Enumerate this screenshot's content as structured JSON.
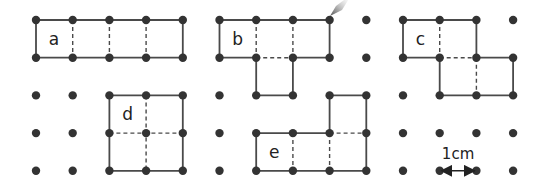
{
  "grid": {
    "cols": 14,
    "rows": 5,
    "origin_x": 36,
    "origin_y": 20,
    "step_x": 36.7,
    "step_y": 37.7,
    "dot_radius": 4.2,
    "dot_color": "#333333",
    "line_color": "#4a4a4a"
  },
  "shapes": [
    {
      "label": "a",
      "label_pos": [
        0.35,
        0.5
      ],
      "outline": [
        [
          0,
          0
        ],
        [
          4,
          0
        ],
        [
          4,
          1
        ],
        [
          0,
          1
        ]
      ],
      "dashed": [
        [
          [
            1,
            0
          ],
          [
            1,
            1
          ]
        ],
        [
          [
            2,
            0
          ],
          [
            2,
            1
          ]
        ],
        [
          [
            3,
            0
          ],
          [
            3,
            1
          ]
        ]
      ]
    },
    {
      "label": "b",
      "label_pos": [
        5.35,
        0.5
      ],
      "outline": [
        [
          5,
          0
        ],
        [
          8,
          0
        ],
        [
          8,
          1
        ],
        [
          7,
          1
        ],
        [
          7,
          2
        ],
        [
          6,
          2
        ],
        [
          6,
          1
        ],
        [
          5,
          1
        ]
      ],
      "dashed": [
        [
          [
            6,
            0
          ],
          [
            6,
            1
          ]
        ],
        [
          [
            7,
            0
          ],
          [
            7,
            1
          ]
        ],
        [
          [
            6,
            1
          ],
          [
            7,
            1
          ]
        ]
      ]
    },
    {
      "label": "c",
      "label_pos": [
        10.35,
        0.5
      ],
      "outline": [
        [
          10,
          0
        ],
        [
          12,
          0
        ],
        [
          12,
          1
        ],
        [
          13,
          1
        ],
        [
          13,
          2
        ],
        [
          11,
          2
        ],
        [
          11,
          1
        ],
        [
          10,
          1
        ]
      ],
      "dashed": [
        [
          [
            11,
            0
          ],
          [
            11,
            1
          ]
        ],
        [
          [
            11,
            1
          ],
          [
            12,
            1
          ]
        ],
        [
          [
            12,
            1
          ],
          [
            12,
            2
          ]
        ]
      ]
    },
    {
      "label": "d",
      "label_pos": [
        2.35,
        2.5
      ],
      "outline": [
        [
          2,
          2
        ],
        [
          4,
          2
        ],
        [
          4,
          4
        ],
        [
          2,
          4
        ]
      ],
      "dashed": [
        [
          [
            3,
            2
          ],
          [
            3,
            4
          ]
        ],
        [
          [
            2,
            3
          ],
          [
            4,
            3
          ]
        ]
      ]
    },
    {
      "label": "e",
      "label_pos": [
        6.35,
        3.5
      ],
      "outline": [
        [
          6,
          3
        ],
        [
          8,
          3
        ],
        [
          8,
          2
        ],
        [
          9,
          2
        ],
        [
          9,
          4
        ],
        [
          6,
          4
        ]
      ],
      "dashed": [
        [
          [
            7,
            3
          ],
          [
            7,
            4
          ]
        ],
        [
          [
            8,
            3
          ],
          [
            8,
            4
          ]
        ],
        [
          [
            8,
            3
          ],
          [
            9,
            3
          ]
        ]
      ]
    }
  ],
  "scale": {
    "label": "1cm",
    "from": [
      11,
      4
    ],
    "to": [
      12,
      4
    ]
  },
  "pencil_tip": {
    "x": 330,
    "y": 8
  }
}
